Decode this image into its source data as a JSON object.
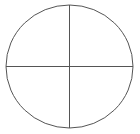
{
  "diagram": {
    "shape": "circle-divided-into-quadrants",
    "circle": {
      "cx": 69.5,
      "cy": 66.5,
      "rx": 63.5,
      "ry": 61.5
    },
    "stroke_color": "#555555",
    "background_color": "#ffffff",
    "quadrants": 4
  }
}
